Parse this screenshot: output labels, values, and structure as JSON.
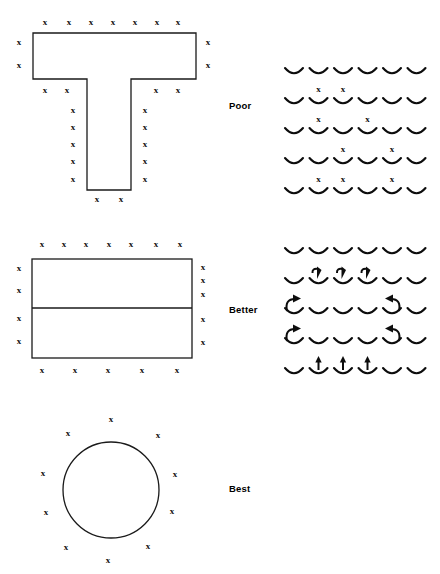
{
  "figure": {
    "title": "",
    "rows": [
      {
        "label": "Poor",
        "shape_name": "t-section-shape",
        "marker_glyph": "x"
      },
      {
        "label": "Better",
        "shape_name": "divided-rectangle-shape",
        "marker_glyph": "x"
      },
      {
        "label": "Best",
        "shape_name": "circle-shape",
        "marker_glyph": "x"
      }
    ]
  },
  "labels": {
    "poor": "Poor",
    "better": "Better",
    "best": "Best"
  },
  "marker": {
    "glyph": "x",
    "color": "#0d0d0d"
  },
  "colors": {
    "outline": "#1a1a1a",
    "symbol": "#0d0d0d",
    "background": "#ffffff",
    "text": "#000000"
  },
  "shapes": {
    "t_section": {
      "name": "t-section-shape",
      "points": "33,33 196,33 196,79 131,79 131,190 87,190 87,79 33,79",
      "x_markers": [
        [
          45,
          23
        ],
        [
          69,
          23
        ],
        [
          91,
          23
        ],
        [
          113,
          23
        ],
        [
          135,
          23
        ],
        [
          157,
          23
        ],
        [
          178,
          23
        ],
        [
          19,
          43
        ],
        [
          19,
          66
        ],
        [
          208,
          43
        ],
        [
          208,
          66
        ],
        [
          45,
          91
        ],
        [
          67,
          91
        ],
        [
          156,
          91
        ],
        [
          178,
          91
        ],
        [
          73,
          111
        ],
        [
          73,
          128
        ],
        [
          73,
          145
        ],
        [
          73,
          162
        ],
        [
          73,
          180
        ],
        [
          145,
          111
        ],
        [
          145,
          128
        ],
        [
          145,
          145
        ],
        [
          145,
          162
        ],
        [
          145,
          180
        ],
        [
          97,
          200
        ],
        [
          121,
          200
        ]
      ]
    },
    "divided_rect": {
      "name": "divided-rectangle-shape",
      "rect": {
        "x": 32,
        "y": 259,
        "width": 160,
        "height": 99
      },
      "divider_y": 308,
      "x_markers": [
        [
          42,
          245
        ],
        [
          64,
          245
        ],
        [
          86,
          245
        ],
        [
          109,
          245
        ],
        [
          131,
          245
        ],
        [
          156,
          245
        ],
        [
          180,
          245
        ],
        [
          19,
          269
        ],
        [
          19,
          291
        ],
        [
          19,
          319
        ],
        [
          19,
          342
        ],
        [
          203,
          268
        ],
        [
          203,
          281
        ],
        [
          203,
          295
        ],
        [
          203,
          320
        ],
        [
          203,
          343
        ],
        [
          42,
          371
        ],
        [
          75,
          371
        ],
        [
          108,
          371
        ],
        [
          142,
          371
        ],
        [
          177,
          371
        ]
      ]
    },
    "circle": {
      "name": "circle-shape",
      "cx": 111,
      "cy": 490,
      "r": 48,
      "x_markers": [
        [
          111,
          420
        ],
        [
          68,
          434
        ],
        [
          158,
          436
        ],
        [
          43,
          474
        ],
        [
          175,
          475
        ],
        [
          46,
          513
        ],
        [
          172,
          512
        ],
        [
          66,
          548
        ],
        [
          148,
          547
        ],
        [
          108,
          561
        ]
      ]
    }
  },
  "patterns": {
    "poor": {
      "name": "poor-cup-grid",
      "description": "grid of cup arcs with x markers above selected cups",
      "cols": 6,
      "rows": 5,
      "origin": {
        "x": 294,
        "y": 72
      },
      "spacing": {
        "x": 24.5,
        "y": 30
      },
      "x_markers": [
        {
          "row": 1,
          "col": 1
        },
        {
          "row": 1,
          "col": 2
        },
        {
          "row": 2,
          "col": 1
        },
        {
          "row": 2,
          "col": 3
        },
        {
          "row": 3,
          "col": 2
        },
        {
          "row": 3,
          "col": 4
        },
        {
          "row": 4,
          "col": 1
        },
        {
          "row": 4,
          "col": 2
        },
        {
          "row": 4,
          "col": 4
        }
      ]
    },
    "better": {
      "name": "better-cup-grid",
      "description": "grid of cup arcs with directional arrows indicating flow out of cups",
      "cols": 6,
      "rows": 5,
      "origin": {
        "x": 294,
        "y": 252
      },
      "spacing": {
        "x": 24.5,
        "y": 30
      },
      "arrows": [
        {
          "row": 1,
          "col": 1,
          "type": "down-hook"
        },
        {
          "row": 1,
          "col": 2,
          "type": "down-hook"
        },
        {
          "row": 1,
          "col": 3,
          "type": "down-hook"
        },
        {
          "row": 2,
          "col": 0,
          "type": "curve-up-right"
        },
        {
          "row": 2,
          "col": 4,
          "type": "curve-up-left"
        },
        {
          "row": 3,
          "col": 0,
          "type": "curve-up-right"
        },
        {
          "row": 3,
          "col": 4,
          "type": "curve-up-left"
        },
        {
          "row": 4,
          "col": 1,
          "type": "up"
        },
        {
          "row": 4,
          "col": 2,
          "type": "up"
        },
        {
          "row": 4,
          "col": 3,
          "type": "up"
        }
      ]
    },
    "best": {
      "name": "best-empty-area",
      "description": "no pattern shown for best row",
      "cols": 0,
      "rows": 0
    }
  }
}
